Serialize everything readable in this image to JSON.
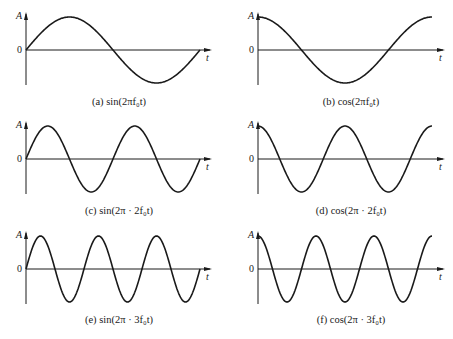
{
  "panels": [
    {
      "id": "a",
      "caption": "(a) sin(2πf₀t)",
      "func": "sin",
      "mult": 1,
      "col": 0,
      "row": 0,
      "y_label": "A",
      "zero_label": "0",
      "x_label": "t"
    },
    {
      "id": "b",
      "caption": "(b) cos(2πf₀t)",
      "func": "cos",
      "mult": 1,
      "col": 1,
      "row": 0,
      "y_label": "A",
      "zero_label": "0",
      "x_label": "t"
    },
    {
      "id": "c",
      "caption": "(c) sin(2π · 2f₀t)",
      "func": "sin",
      "mult": 2,
      "col": 0,
      "row": 1,
      "y_label": "A",
      "zero_label": "0",
      "x_label": "t"
    },
    {
      "id": "d",
      "caption": "(d) cos(2π · 2f₀t)",
      "func": "cos",
      "mult": 2,
      "col": 1,
      "row": 1,
      "y_label": "A",
      "zero_label": "0",
      "x_label": "t"
    },
    {
      "id": "e",
      "caption": "(e) sin(2π · 3f₀t)",
      "func": "sin",
      "mult": 3,
      "col": 0,
      "row": 2,
      "y_label": "A",
      "zero_label": "0",
      "x_label": "t"
    },
    {
      "id": "f",
      "caption": "(f) cos(2π · 3f₀t)",
      "func": "cos",
      "mult": 3,
      "col": 1,
      "row": 2,
      "y_label": "A",
      "zero_label": "0",
      "x_label": "t"
    }
  ],
  "layout": {
    "cols": [
      {
        "axis_x": 26,
        "end_x": 200,
        "arrow_x": 212
      },
      {
        "axis_x": 258,
        "end_x": 432,
        "arrow_x": 445
      }
    ],
    "rows": [
      {
        "zero_y": 50,
        "amp": 33,
        "caption_y": 96
      },
      {
        "zero_y": 159,
        "amp": 33,
        "caption_y": 205
      },
      {
        "zero_y": 269,
        "amp": 33,
        "caption_y": 314
      }
    ],
    "stroke": "#1a1a1a"
  }
}
